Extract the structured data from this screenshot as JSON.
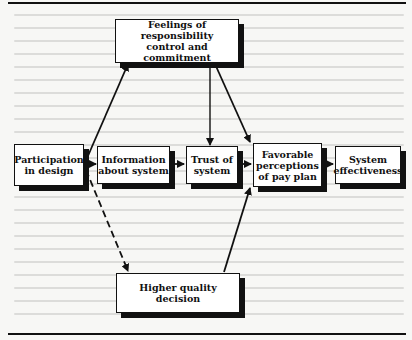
{
  "diagram": {
    "nodes": [
      {
        "id": "participation",
        "label": "Participation in design",
        "lines": [
          "Participation",
          "in design"
        ]
      },
      {
        "id": "information",
        "label": "Information about system",
        "lines": [
          "Information",
          "about system"
        ]
      },
      {
        "id": "trust",
        "label": "Trust of system",
        "lines": [
          "Trust of",
          "system"
        ]
      },
      {
        "id": "favorable",
        "label": "Favorable perceptions of pay plan",
        "lines": [
          "Favorable",
          "perceptions",
          "of pay plan"
        ]
      },
      {
        "id": "effectiveness",
        "label": "System effectiveness",
        "lines": [
          "System",
          "effectiveness"
        ]
      },
      {
        "id": "feelings",
        "label": "Feelings of responsibility control and commitment",
        "lines": [
          "Feelings of responsibility",
          "control and commitment"
        ]
      },
      {
        "id": "quality",
        "label": "Higher quality decision",
        "lines": [
          "Higher quality",
          "decision"
        ]
      }
    ],
    "edges": [
      {
        "from": "participation",
        "to": "feelings",
        "style": "solid"
      },
      {
        "from": "participation",
        "to": "information",
        "style": "solid"
      },
      {
        "from": "participation",
        "to": "quality",
        "style": "dashed"
      },
      {
        "from": "information",
        "to": "trust",
        "style": "solid"
      },
      {
        "from": "feelings",
        "to": "trust",
        "style": "solid"
      },
      {
        "from": "feelings",
        "to": "favorable",
        "style": "solid"
      },
      {
        "from": "trust",
        "to": "favorable",
        "style": "solid"
      },
      {
        "from": "quality",
        "to": "favorable",
        "style": "solid"
      },
      {
        "from": "favorable",
        "to": "effectiveness",
        "style": "solid"
      }
    ]
  }
}
